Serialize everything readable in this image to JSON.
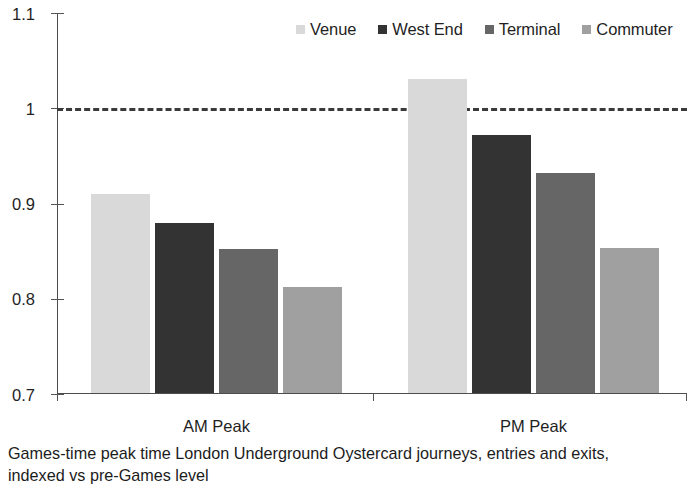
{
  "chart_data": {
    "type": "bar",
    "title": "",
    "subtitle": "",
    "caption": "Games-time peak time London Underground Oystercard journeys, entries and exits, indexed vs pre-Games level",
    "xlabel": "",
    "ylabel": "",
    "categories": [
      "AM Peak",
      "PM Peak"
    ],
    "ylim": [
      0.7,
      1.1
    ],
    "yticks": [
      0.7,
      0.8,
      0.9,
      1.0,
      1.1
    ],
    "ytick_labels": [
      "0.7",
      "0.8",
      "0.9",
      "1",
      "1.1"
    ],
    "grid": false,
    "legend_position": "top-right",
    "reference_line": {
      "value": 1.0,
      "style": "dashed",
      "color": "#3a3a3a"
    },
    "series": [
      {
        "name": "Venue",
        "color": "#d9d9d9",
        "values": [
          0.91,
          1.031
        ]
      },
      {
        "name": "West End",
        "color": "#333333",
        "values": [
          0.88,
          0.972
        ]
      },
      {
        "name": "Terminal",
        "color": "#666666",
        "values": [
          0.852,
          0.932
        ]
      },
      {
        "name": "Commuter",
        "color": "#a0a0a0",
        "values": [
          0.812,
          0.853
        ]
      }
    ]
  },
  "legend": {
    "items": [
      {
        "label": "Venue"
      },
      {
        "label": "West End"
      },
      {
        "label": "Terminal"
      },
      {
        "label": "Commuter"
      }
    ]
  },
  "axis": {
    "y_labels": [
      "1.1",
      "1",
      "0.9",
      "0.8",
      "0.7"
    ],
    "x_labels": [
      "AM Peak",
      "PM Peak"
    ]
  },
  "caption": {
    "text": "Games-time peak time London Underground Oystercard journeys, entries and exits, indexed vs pre-Games level"
  }
}
